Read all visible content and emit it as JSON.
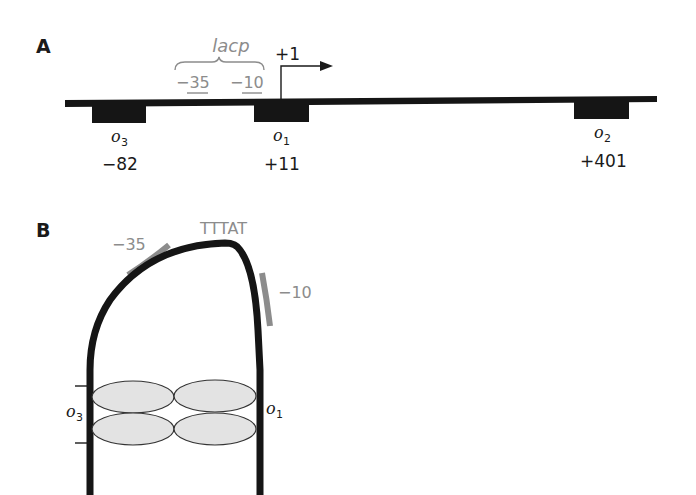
{
  "panel_a": {
    "label": "A",
    "promoter": {
      "name": "lacp",
      "minus35": "−35",
      "minus10": "−10"
    },
    "start_site": "+1",
    "operators": [
      {
        "name": "o",
        "sub": "3",
        "position": "−82"
      },
      {
        "name": "o",
        "sub": "1",
        "position": "+11"
      },
      {
        "name": "o",
        "sub": "2",
        "position": "+401"
      }
    ]
  },
  "panel_b": {
    "label": "B",
    "sequence_label": "TTTAT",
    "minus35": "−35",
    "minus10": "−10",
    "left_operator": {
      "name": "o",
      "sub": "3"
    },
    "right_operator": {
      "name": "o",
      "sub": "1"
    }
  },
  "colors": {
    "dna": "#151515",
    "promoter_grey": "#8c8c8c",
    "repressor_fill": "#e3e3e3"
  }
}
